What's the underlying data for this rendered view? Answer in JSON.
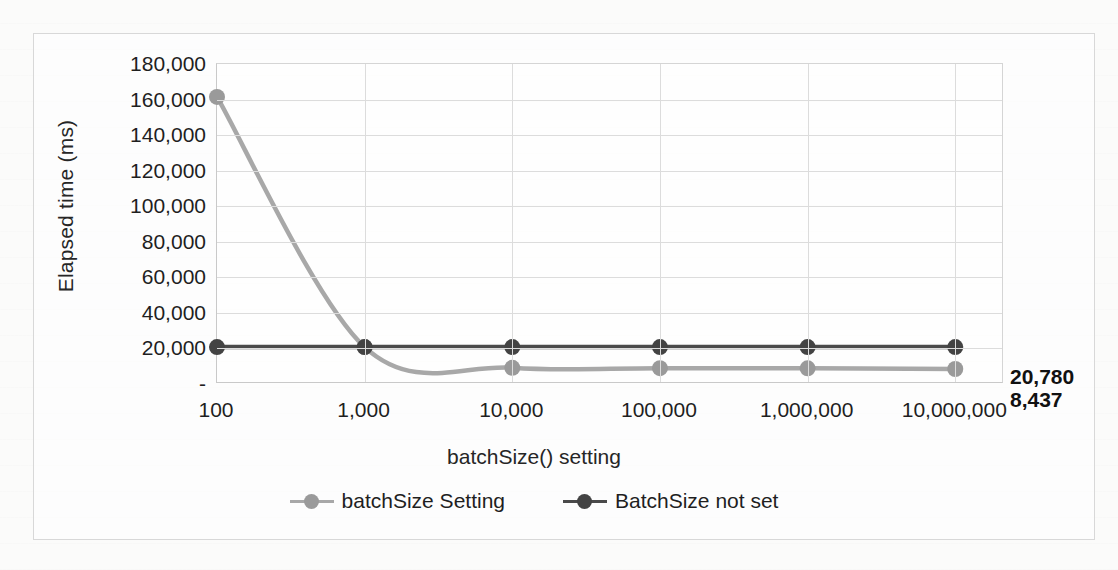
{
  "chart_data": {
    "type": "line",
    "title": "",
    "xlabel": "batchSize() setting",
    "ylabel": "Elapsed time (ms)",
    "categories": [
      "100",
      "1,000",
      "10,000",
      "100,000",
      "1,000,000",
      "10,000,000"
    ],
    "x_values": [
      100,
      1000,
      10000,
      100000,
      1000000,
      10000000
    ],
    "ylim": [
      0,
      180000
    ],
    "ytick_labels": [
      "180,000",
      "160,000",
      "140,000",
      "120,000",
      "100,000",
      "80,000",
      "60,000",
      "40,000",
      "20,000",
      "-"
    ],
    "ytick_values": [
      180000,
      160000,
      140000,
      120000,
      100000,
      80000,
      60000,
      40000,
      20000,
      0
    ],
    "grid": true,
    "legend_position": "bottom",
    "smooth": true,
    "series": [
      {
        "name": "batchSize Setting",
        "color": "#a8a8a8",
        "marker_color": "#9a9a9a",
        "values": [
          161500,
          20780,
          9100,
          8900,
          8800,
          8437
        ],
        "end_label": "8,437"
      },
      {
        "name": "BatchSize not set",
        "color": "#4a4a4a",
        "marker_color": "#434343",
        "values": [
          20780,
          20780,
          20780,
          20780,
          20780,
          20780
        ],
        "end_label": "20,780"
      }
    ]
  },
  "axis": {
    "y_title": "Elapsed time (ms)",
    "x_title": "batchSize() setting"
  },
  "legend": {
    "entries": [
      {
        "label": "batchSize Setting"
      },
      {
        "label": "BatchSize not set"
      }
    ]
  },
  "labels": {
    "dark_end": "20,780",
    "light_end": "8,437"
  },
  "page_background_text": {
    "line_top": "",
    "line_middle": "",
    "line_bottom": ""
  }
}
